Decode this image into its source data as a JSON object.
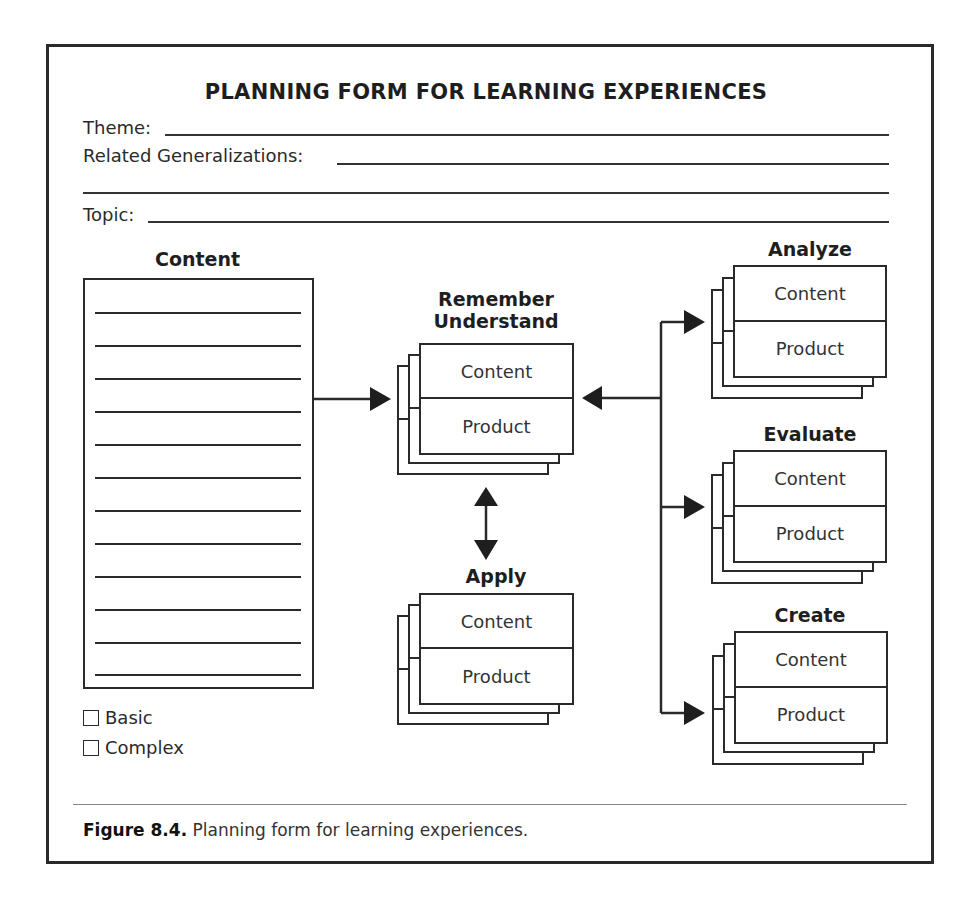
{
  "form": {
    "title": "PLANNING FORM FOR LEARNING EXPERIENCES",
    "fields": {
      "theme_label": "Theme:",
      "theme_value": "",
      "generalizations_label": "Related Generalizations:",
      "generalizations_value": "",
      "topic_label": "Topic:",
      "topic_value": ""
    }
  },
  "content_panel": {
    "heading": "Content",
    "line_count": 12,
    "options": [
      {
        "label": "Basic",
        "checked": false
      },
      {
        "label": "Complex",
        "checked": false
      }
    ]
  },
  "stacks": {
    "remember": {
      "heading_line1": "Remember",
      "heading_line2": "Understand",
      "top": "Content",
      "bottom": "Product"
    },
    "apply": {
      "heading": "Apply",
      "top": "Content",
      "bottom": "Product"
    },
    "analyze": {
      "heading": "Analyze",
      "top": "Content",
      "bottom": "Product"
    },
    "evaluate": {
      "heading": "Evaluate",
      "top": "Content",
      "bottom": "Product"
    },
    "create": {
      "heading": "Create",
      "top": "Content",
      "bottom": "Product"
    }
  },
  "caption": {
    "label": "Figure 8.4.",
    "text": " Planning form for learning experiences."
  },
  "colors": {
    "line": "#2a2a2a",
    "text": "#222222",
    "background": "#ffffff"
  }
}
